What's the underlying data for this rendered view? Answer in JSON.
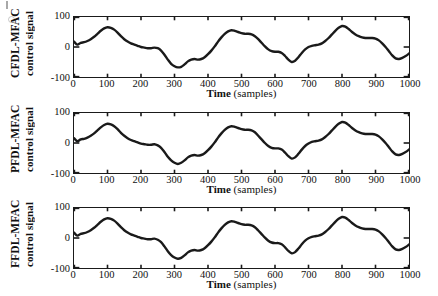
{
  "figure": {
    "type": "multi-panel-line",
    "panel_count": 3,
    "background": "#ffffff",
    "line_color": "#1a1a1a"
  },
  "axis": {
    "x_label_bold": "Time",
    "x_label_rest": " (samples)",
    "x_ticks": [
      "0",
      "100",
      "200",
      "300",
      "400",
      "500",
      "600",
      "700",
      "800",
      "900",
      "1000"
    ],
    "y_ticks": [
      "100",
      "0",
      "-100"
    ],
    "xlim": [
      0,
      1000
    ],
    "ylim": [
      -100,
      100
    ]
  },
  "panels": [
    {
      "y_label_line1": "CFDL-MFAC",
      "y_label_line2": "control signal"
    },
    {
      "y_label_line1": "PFDL-MFAC",
      "y_label_line2": "control signal"
    },
    {
      "y_label_line1": "FFDL-MFAC",
      "y_label_line2": "control signal"
    }
  ],
  "chart_data": {
    "type": "line",
    "title": "",
    "xlabel": "Time (samples)",
    "ylabel": "control signal",
    "xlim": [
      0,
      1000
    ],
    "ylim": [
      -100,
      100
    ],
    "grid": false,
    "legend": "none",
    "x_ticks": [
      0,
      100,
      200,
      300,
      400,
      500,
      600,
      700,
      800,
      900,
      1000
    ],
    "y_ticks": [
      -100,
      0,
      100
    ],
    "x": [
      0,
      10,
      20,
      30,
      40,
      50,
      60,
      70,
      80,
      90,
      100,
      110,
      120,
      130,
      140,
      150,
      160,
      170,
      180,
      190,
      200,
      210,
      220,
      230,
      240,
      250,
      260,
      270,
      280,
      290,
      300,
      310,
      320,
      330,
      340,
      350,
      360,
      370,
      380,
      390,
      400,
      410,
      420,
      430,
      440,
      450,
      460,
      470,
      480,
      490,
      500,
      510,
      520,
      530,
      540,
      550,
      560,
      570,
      580,
      590,
      600,
      610,
      620,
      630,
      640,
      650,
      660,
      670,
      680,
      690,
      700,
      710,
      720,
      730,
      740,
      750,
      760,
      770,
      780,
      790,
      800,
      810,
      820,
      830,
      840,
      850,
      860,
      870,
      880,
      890,
      900,
      910,
      920,
      930,
      940,
      950,
      960,
      970,
      980,
      990,
      1000
    ],
    "series": [
      {
        "name": "CFDL-MFAC control signal",
        "panel": 1,
        "y_label": "CFDL-MFAC control signal",
        "values": [
          18,
          8,
          14,
          16,
          20,
          26,
          34,
          44,
          54,
          62,
          66,
          64,
          58,
          48,
          36,
          26,
          18,
          12,
          8,
          4,
          0,
          -2,
          -4,
          -4,
          -2,
          -4,
          -12,
          -26,
          -42,
          -56,
          -64,
          -68,
          -66,
          -58,
          -48,
          -42,
          -40,
          -42,
          -40,
          -34,
          -24,
          -12,
          2,
          18,
          32,
          44,
          52,
          56,
          54,
          50,
          46,
          44,
          44,
          42,
          36,
          26,
          14,
          2,
          -8,
          -14,
          -16,
          -16,
          -20,
          -30,
          -42,
          -50,
          -46,
          -34,
          -20,
          -8,
          0,
          4,
          6,
          8,
          12,
          20,
          30,
          42,
          54,
          64,
          70,
          68,
          60,
          50,
          42,
          36,
          32,
          30,
          30,
          30,
          28,
          22,
          12,
          0,
          -14,
          -28,
          -38,
          -40,
          -36,
          -30,
          -22
        ]
      },
      {
        "name": "PFDL-MFAC control signal",
        "panel": 2,
        "y_label": "PFDL-MFAC control signal",
        "values": [
          16,
          6,
          12,
          14,
          18,
          24,
          32,
          42,
          52,
          60,
          64,
          62,
          56,
          46,
          34,
          24,
          16,
          10,
          6,
          2,
          -2,
          -4,
          -6,
          -6,
          -4,
          -8,
          -16,
          -30,
          -46,
          -58,
          -66,
          -70,
          -66,
          -58,
          -48,
          -42,
          -40,
          -42,
          -40,
          -34,
          -24,
          -12,
          2,
          18,
          32,
          44,
          52,
          56,
          54,
          50,
          46,
          44,
          44,
          42,
          36,
          24,
          12,
          0,
          -10,
          -16,
          -18,
          -18,
          -22,
          -32,
          -44,
          -52,
          -48,
          -36,
          -22,
          -10,
          -2,
          4,
          6,
          8,
          12,
          20,
          30,
          42,
          54,
          64,
          70,
          68,
          60,
          50,
          42,
          36,
          32,
          30,
          30,
          30,
          28,
          22,
          12,
          0,
          -14,
          -28,
          -38,
          -40,
          -36,
          -30,
          -22
        ]
      },
      {
        "name": "FFDL-MFAC control signal",
        "panel": 3,
        "y_label": "FFDL-MFAC control signal",
        "values": [
          18,
          8,
          14,
          16,
          20,
          26,
          34,
          44,
          54,
          62,
          66,
          64,
          58,
          48,
          36,
          26,
          18,
          12,
          8,
          4,
          0,
          -2,
          -4,
          -4,
          -2,
          -6,
          -14,
          -28,
          -44,
          -57,
          -65,
          -69,
          -66,
          -58,
          -48,
          -42,
          -40,
          -42,
          -40,
          -34,
          -24,
          -12,
          2,
          18,
          32,
          44,
          52,
          56,
          54,
          50,
          46,
          44,
          44,
          42,
          36,
          25,
          13,
          1,
          -9,
          -15,
          -17,
          -17,
          -21,
          -31,
          -43,
          -51,
          -47,
          -35,
          -21,
          -9,
          -1,
          4,
          6,
          8,
          12,
          20,
          30,
          42,
          54,
          64,
          70,
          68,
          60,
          50,
          42,
          36,
          32,
          30,
          30,
          30,
          28,
          22,
          12,
          0,
          -14,
          -28,
          -38,
          -40,
          -36,
          -30,
          -22
        ]
      }
    ]
  }
}
